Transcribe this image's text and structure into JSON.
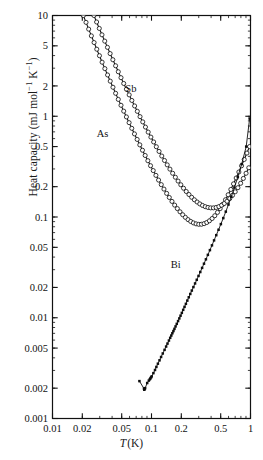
{
  "chart_data": {
    "type": "scatter",
    "title": "",
    "xlabel": "T (K)",
    "ylabel": "Heat capacity (mJ mol⁻¹ K⁻¹)",
    "xscale": "log",
    "yscale": "log",
    "xlim": [
      0.01,
      1
    ],
    "ylim": [
      0.001,
      10
    ],
    "grid": false,
    "legend_position": "inline-annotations",
    "xticks": [
      0.01,
      0.02,
      0.05,
      0.1,
      0.2,
      0.5,
      1
    ],
    "xtick_labels": [
      "0.01",
      "0.02",
      "0.05",
      "0.1",
      "0.2",
      "0.5",
      "1"
    ],
    "yticks": [
      0.001,
      0.002,
      0.005,
      0.01,
      0.02,
      0.05,
      0.1,
      0.2,
      0.5,
      1,
      2,
      5,
      10
    ],
    "ytick_labels": [
      "0.001",
      "0.002",
      "0.005",
      "0.01",
      "0.02",
      "0.05",
      "0.1",
      "0.2",
      "0.5",
      "1",
      "2",
      "5",
      "10"
    ],
    "annotations": [
      {
        "text": "Sb",
        "x": 0.062,
        "y": 1.75
      },
      {
        "text": "As",
        "x": 0.032,
        "y": 0.62
      },
      {
        "text": "Bi",
        "x": 0.175,
        "y": 0.031
      }
    ],
    "series": [
      {
        "name": "As",
        "marker": "open-circle",
        "color": "#151515",
        "line": "solid",
        "x": [
          0.0205,
          0.0218,
          0.0232,
          0.0247,
          0.0263,
          0.028,
          0.0298,
          0.0317,
          0.0338,
          0.036,
          0.0383,
          0.0408,
          0.0434,
          0.0462,
          0.0492,
          0.0524,
          0.0558,
          0.0594,
          0.0632,
          0.0673,
          0.0716,
          0.0762,
          0.0811,
          0.0863,
          0.0919,
          0.0978,
          0.1041,
          0.1108,
          0.1179,
          0.1255,
          0.1336,
          0.1422,
          0.1513,
          0.161,
          0.1714,
          0.1824,
          0.1941,
          0.2066,
          0.2199,
          0.234,
          0.249,
          0.265,
          0.282,
          0.3,
          0.3193,
          0.3398,
          0.3616,
          0.3848,
          0.4095,
          0.4358,
          0.4638,
          0.4936,
          0.5253,
          0.559,
          0.5949,
          0.6331,
          0.6737,
          0.717,
          0.763,
          0.812,
          0.8641,
          0.9196,
          0.9787
        ],
        "y": [
          10.0,
          8.55,
          7.32,
          6.28,
          5.39,
          4.63,
          3.99,
          3.44,
          2.97,
          2.57,
          2.23,
          1.94,
          1.69,
          1.47,
          1.285,
          1.124,
          0.985,
          0.864,
          0.759,
          0.668,
          0.589,
          0.52,
          0.46,
          0.408,
          0.362,
          0.323,
          0.289,
          0.259,
          0.2325,
          0.2095,
          0.1893,
          0.1716,
          0.1562,
          0.1428,
          0.1312,
          0.1212,
          0.1126,
          0.1053,
          0.0992,
          0.0942,
          0.0903,
          0.0874,
          0.0855,
          0.0846,
          0.0847,
          0.0859,
          0.0882,
          0.0917,
          0.0966,
          0.103,
          0.1111,
          0.1211,
          0.1334,
          0.1483,
          0.1662,
          0.1877,
          0.2133,
          0.2437,
          0.2797,
          0.3222,
          0.3723,
          0.4311,
          0.5
        ]
      },
      {
        "name": "Sb",
        "marker": "open-circle",
        "color": "#151515",
        "line": "solid",
        "x": [
          0.0262,
          0.0279,
          0.0297,
          0.0316,
          0.0337,
          0.0359,
          0.0382,
          0.0407,
          0.0434,
          0.0462,
          0.0492,
          0.0524,
          0.0558,
          0.0595,
          0.0633,
          0.0675,
          0.0719,
          0.0766,
          0.0816,
          0.0869,
          0.0926,
          0.0986,
          0.1051,
          0.1119,
          0.1192,
          0.127,
          0.1353,
          0.1441,
          0.1535,
          0.1635,
          0.1742,
          0.1856,
          0.1977,
          0.2106,
          0.2243,
          0.2389,
          0.2545,
          0.2711,
          0.2888,
          0.3076,
          0.3277,
          0.3491,
          0.3719,
          0.3962,
          0.4221,
          0.4497,
          0.4791,
          0.5104,
          0.5438,
          0.5793,
          0.6172,
          0.6575,
          0.7005,
          0.7463,
          0.7951,
          0.847,
          0.9024,
          0.9613
        ],
        "y": [
          10.0,
          8.62,
          7.44,
          6.43,
          5.57,
          4.83,
          4.19,
          3.64,
          3.17,
          2.765,
          2.415,
          2.115,
          1.855,
          1.63,
          1.435,
          1.266,
          1.119,
          0.991,
          0.879,
          0.781,
          0.696,
          0.621,
          0.556,
          0.498,
          0.4475,
          0.403,
          0.3638,
          0.3292,
          0.2987,
          0.2718,
          0.2481,
          0.2273,
          0.209,
          0.1931,
          0.1792,
          0.1672,
          0.1569,
          0.1482,
          0.1409,
          0.1349,
          0.1302,
          0.1267,
          0.1244,
          0.1232,
          0.1232,
          0.1244,
          0.1269,
          0.1308,
          0.1362,
          0.1434,
          0.1525,
          0.1639,
          0.178,
          0.1952,
          0.2161,
          0.2414,
          0.2718,
          0.3082
        ]
      },
      {
        "name": "Bi",
        "marker": "filled-square",
        "color": "#0d0d0d",
        "line": "solid",
        "x": [
          0.0755,
          0.084,
          0.0845,
          0.085,
          0.0862,
          0.0905,
          0.094,
          0.0962,
          0.0975,
          0.099,
          0.1005,
          0.1045,
          0.1085,
          0.112,
          0.116,
          0.1205,
          0.125,
          0.13,
          0.1355,
          0.1405,
          0.145,
          0.15,
          0.1545,
          0.1585,
          0.1625,
          0.1665,
          0.1705,
          0.175,
          0.18,
          0.1855,
          0.191,
          0.1965,
          0.2025,
          0.209,
          0.2155,
          0.2225,
          0.23,
          0.238,
          0.2465,
          0.2555,
          0.265,
          0.2755,
          0.2865,
          0.2985,
          0.311,
          0.3245,
          0.339,
          0.3545,
          0.371,
          0.389,
          0.408,
          0.4285,
          0.451,
          0.4755,
          0.502,
          0.531,
          0.563,
          0.599,
          0.64,
          0.688,
          0.745,
          0.815,
          0.905,
          0.98
        ],
        "y": [
          0.00235,
          0.00198,
          0.00193,
          0.00196,
          0.002,
          0.00225,
          0.00238,
          0.00245,
          0.0025,
          0.00256,
          0.00262,
          0.00282,
          0.00303,
          0.00325,
          0.0035,
          0.00378,
          0.00408,
          0.00442,
          0.0048,
          0.00518,
          0.00554,
          0.00594,
          0.00632,
          0.00666,
          0.00702,
          0.00738,
          0.00776,
          0.0082,
          0.0087,
          0.00926,
          0.00985,
          0.01048,
          0.01118,
          0.01198,
          0.01282,
          0.01375,
          0.0148,
          0.01596,
          0.01722,
          0.01862,
          0.02015,
          0.0219,
          0.0238,
          0.026,
          0.02845,
          0.03125,
          0.0344,
          0.038,
          0.0421,
          0.0469,
          0.0523,
          0.0586,
          0.066,
          0.0747,
          0.085,
          0.0975,
          0.113,
          0.133,
          0.159,
          0.196,
          0.25,
          0.335,
          0.5,
          0.95
        ]
      }
    ]
  }
}
